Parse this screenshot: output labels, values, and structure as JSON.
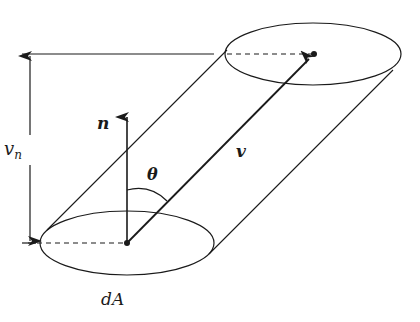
{
  "diagram": {
    "labels": {
      "normal": "n",
      "velocity": "v",
      "normal_component_main": "v",
      "normal_component_sub": "n",
      "angle": "θ",
      "area": "dA"
    },
    "colors": {
      "stroke": "#1a1a1a",
      "background": "#ffffff"
    },
    "elements": [
      "bottom-ellipse (dA)",
      "top-ellipse",
      "cylinder-side-left",
      "cylinder-side-right",
      "normal-vector-arrow (n)",
      "velocity-vector-arrow (v)",
      "height-dimension-arrow (v_n)",
      "angle-arc (theta)",
      "dashed-radius-bottom",
      "dashed-radius-top",
      "top-reference-line"
    ]
  }
}
